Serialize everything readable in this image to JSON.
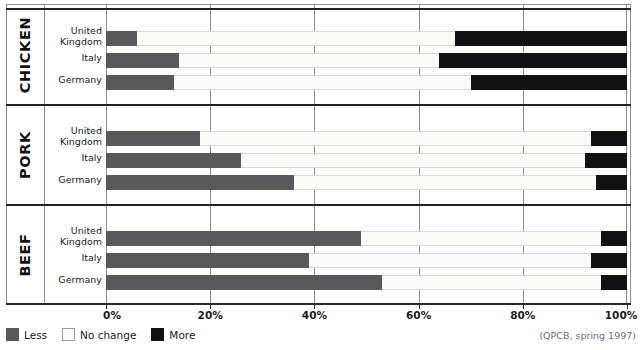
{
  "chart_data": {
    "type": "bar",
    "orientation": "horizontal",
    "style": "stacked-100-percent",
    "title": "",
    "subtitle": "",
    "xlabel": "",
    "ylabel": "",
    "xlim": [
      0,
      100
    ],
    "xticks": [
      0,
      20,
      40,
      60,
      80,
      100
    ],
    "xticklabels": [
      "0%",
      "20%",
      "40%",
      "60%",
      "80%",
      "100%"
    ],
    "grid": true,
    "legend_position": "bottom-left",
    "source_note": "(QPCB, spring 1997)",
    "legend": [
      "Less",
      "No change",
      "More"
    ],
    "series": [
      {
        "name": "Less",
        "color": "#59595b"
      },
      {
        "name": "No change",
        "color": "#fbfbfa"
      },
      {
        "name": "More",
        "color": "#111113"
      }
    ],
    "groups": [
      {
        "label": "CHICKEN",
        "rows": [
          {
            "category": "United\nKingdom",
            "line1": "United",
            "line2": "Kingdom",
            "values": [
              6,
              61,
              33
            ]
          },
          {
            "category": "Italy",
            "line1": "Italy",
            "line2": "",
            "values": [
              14,
              50,
              36
            ]
          },
          {
            "category": "Germany",
            "line1": "Germany",
            "line2": "",
            "values": [
              13,
              57,
              30
            ]
          }
        ]
      },
      {
        "label": "PORK",
        "rows": [
          {
            "category": "United\nKingdom",
            "line1": "United",
            "line2": "Kingdom",
            "values": [
              18,
              75,
              7
            ]
          },
          {
            "category": "Italy",
            "line1": "Italy",
            "line2": "",
            "values": [
              26,
              66,
              8
            ]
          },
          {
            "category": "Germany",
            "line1": "Germany",
            "line2": "",
            "values": [
              36,
              58,
              6
            ]
          }
        ]
      },
      {
        "label": "BEEF",
        "rows": [
          {
            "category": "United\nKingdom",
            "line1": "United",
            "line2": "Kingdom",
            "values": [
              49,
              46,
              5
            ]
          },
          {
            "category": "Italy",
            "line1": "Italy",
            "line2": "",
            "values": [
              39,
              54,
              7
            ]
          },
          {
            "category": "Germany",
            "line1": "Germany",
            "line2": "",
            "values": [
              53,
              42,
              5
            ]
          }
        ]
      }
    ]
  }
}
